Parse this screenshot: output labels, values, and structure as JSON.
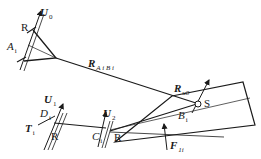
{
  "labels": {
    "U0": {
      "base": "U",
      "sub": "0"
    },
    "R_top": "R",
    "Ai": {
      "base": "A",
      "sub": "i"
    },
    "RAiBi": {
      "base": "R",
      "sub": "A i B i"
    },
    "Ru0": {
      "base": "R",
      "sub": "u0"
    },
    "S": "S",
    "Bi": {
      "base": "B",
      "sub": "i"
    },
    "U1": {
      "base": "U",
      "sub": "1"
    },
    "Di": {
      "base": "D",
      "sub": "i"
    },
    "Ti": {
      "base": "T",
      "sub": "i"
    },
    "R_left": "R",
    "U2": {
      "base": "U",
      "sub": "2"
    },
    "Ci": {
      "base": "C",
      "sub": "i"
    },
    "R_mid": "R",
    "F1i": {
      "base": "F",
      "sub": "1i"
    }
  },
  "colors": {
    "stroke": "#1a1a1a",
    "background": "#ffffff"
  }
}
